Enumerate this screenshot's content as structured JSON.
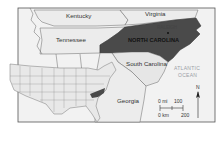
{
  "map": {
    "title": "",
    "highlight_state": "NORTH CAROLINA",
    "capital": "RALEIGH",
    "state_labels": [
      "Kentucky",
      "Virginia",
      "Tennessee",
      "South Carolina",
      "Georgia"
    ],
    "water_label_line1": "ATLANTIC",
    "water_label_line2": "OCEAN",
    "scale": {
      "mi_label": "0 mi",
      "mi_value": "100",
      "km_label": "0 km",
      "km_value": "200"
    },
    "north_arrow": "N",
    "colors": {
      "highlight": "#4a4a4a",
      "land": "#e9e9e9",
      "border": "#666666",
      "frame": "#555555",
      "ocean_text": "#9aa0a6"
    },
    "inset": "Contiguous United States locator map with North Carolina highlighted"
  }
}
